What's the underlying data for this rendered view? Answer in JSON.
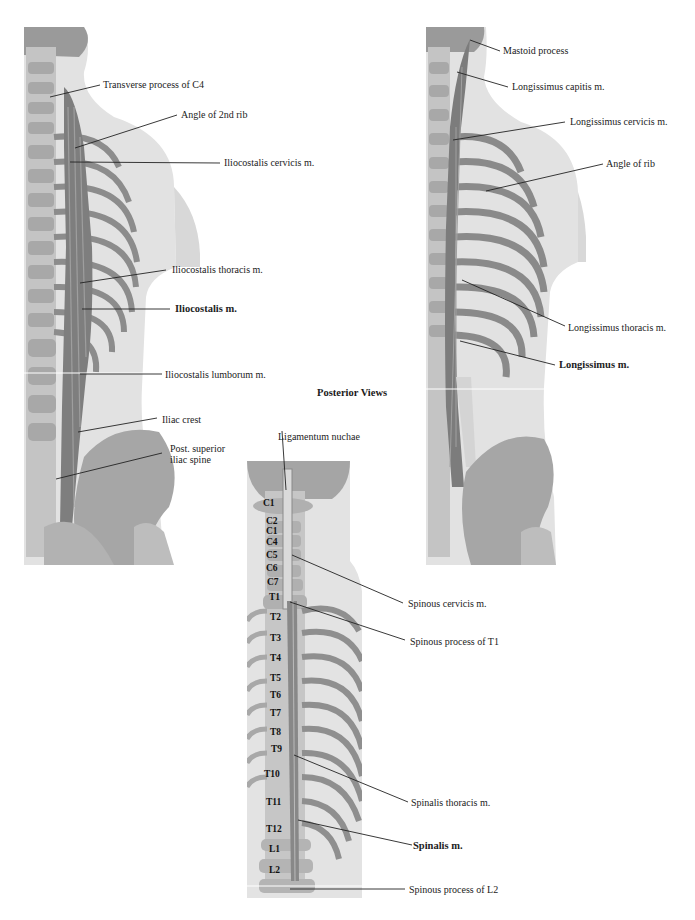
{
  "figure": {
    "title": "Posterior Views"
  },
  "left_panel": {
    "name": "Iliocostalis",
    "labels": {
      "transverse_process_c4": "Transverse process of C4",
      "angle_2nd_rib": "Angle of 2nd rib",
      "iliocostalis_cervicis": "Iliocostalis cervicis m.",
      "iliocostalis_thoracis": "Iliocostalis thoracis m.",
      "iliocostalis": "Iliocostalis m.",
      "iliocostalis_lumborum": "Iliocostalis lumborum m.",
      "iliac_crest": "Iliac crest",
      "post_superior_1": "Post. superior",
      "post_superior_2": "iliac spine"
    }
  },
  "right_panel": {
    "name": "Longissimus",
    "labels": {
      "mastoid_process": "Mastoid process",
      "longissimus_capitis": "Longissimus capitis m.",
      "longissimus_cervicis": "Longissimus cervicis m.",
      "angle_of_rib": "Angle of rib",
      "longissimus_thoracis": "Longissimus thoracis m.",
      "longissimus": "Longissimus m."
    }
  },
  "center_panel": {
    "name": "Spinalis",
    "labels": {
      "ligamentum_nuchae": "Ligamentum nuchae",
      "spinous_cervicis": "Spinous cervicis m.",
      "spinous_process_t1": "Spinous process of T1",
      "spinalis_thoracis": "Spinalis thoracis m.",
      "spinalis": "Spinalis m.",
      "spinous_process_l2": "Spinous process of L2"
    },
    "vertebrae": [
      "C1",
      "C2",
      "C1",
      "C4",
      "C5",
      "C6",
      "C7",
      "T1",
      "T2",
      "T3",
      "T4",
      "T5",
      "T6",
      "T7",
      "T8",
      "T9",
      "T10",
      "T11",
      "T12",
      "L1",
      "L2"
    ]
  },
  "colors": {
    "background": "#ffffff",
    "skin": "#e4e4e4",
    "bone": "#b8b8b8",
    "muscle": "#8a8a8a",
    "leader": "#222222"
  }
}
